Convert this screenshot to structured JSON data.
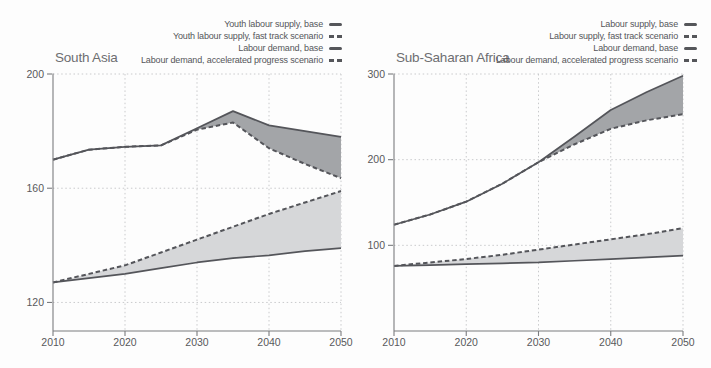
{
  "colors": {
    "line": "#54555a",
    "band_dark": "#a3a5a8",
    "band_light": "#d6d7d9",
    "grid": "#c9cacc",
    "axis": "#7b7c7f",
    "tick_text": "#58595b",
    "title_text": "#6d6e71"
  },
  "chart_data": [
    {
      "type": "line",
      "title": "South Asia",
      "x": [
        2010,
        2015,
        2020,
        2025,
        2030,
        2035,
        2040,
        2045,
        2050
      ],
      "xticks": [
        2010,
        2020,
        2030,
        2040,
        2050
      ],
      "yticks": [
        120,
        160,
        200
      ],
      "ylim": [
        110,
        200
      ],
      "grid": true,
      "legend_position": "top-right",
      "series": [
        {
          "label": "Youth labour supply, base",
          "style": "solid",
          "values": [
            170,
            173.5,
            174.5,
            175,
            181,
            187,
            182,
            180,
            178
          ]
        },
        {
          "label": "Youth labour supply, fast track scenario",
          "style": "dashed",
          "values": [
            170,
            173.5,
            174.5,
            175,
            180.5,
            183,
            174,
            168.5,
            163.5
          ]
        },
        {
          "label": "Labour demand, base",
          "style": "solid",
          "values": [
            127,
            128.5,
            130,
            132,
            134,
            135.5,
            136.5,
            138,
            139
          ]
        },
        {
          "label": "Labour demand, accelerated progress scenario",
          "style": "dashed",
          "values": [
            127,
            130,
            133,
            137.5,
            142,
            146.5,
            151,
            155,
            159
          ]
        }
      ],
      "bands": [
        {
          "upper": 0,
          "lower": 1,
          "tone": "band_dark"
        },
        {
          "upper": 3,
          "lower": 2,
          "tone": "band_light"
        }
      ]
    },
    {
      "type": "line",
      "title": "Sub-Saharan Africa",
      "x": [
        2010,
        2015,
        2020,
        2025,
        2030,
        2035,
        2040,
        2045,
        2050
      ],
      "xticks": [
        2010,
        2020,
        2030,
        2040,
        2050
      ],
      "yticks": [
        100,
        200,
        300
      ],
      "ylim": [
        0,
        300
      ],
      "grid": true,
      "legend_position": "top-right",
      "series": [
        {
          "label": "Labour supply, base",
          "style": "solid",
          "values": [
            124,
            136,
            151,
            172,
            197,
            227,
            258,
            279,
            298
          ]
        },
        {
          "label": "Labour supply, fast track scenario",
          "style": "dashed",
          "values": [
            124,
            136,
            151,
            172,
            197,
            218,
            236,
            246,
            253
          ]
        },
        {
          "label": "Labour demand, base",
          "style": "solid",
          "values": [
            76,
            77,
            78,
            79,
            80,
            82,
            84,
            86,
            88
          ]
        },
        {
          "label": "Labour demand, accelerated progress scenario",
          "style": "dashed",
          "values": [
            76,
            80,
            84,
            89,
            95,
            101,
            107,
            113,
            120
          ]
        }
      ],
      "bands": [
        {
          "upper": 0,
          "lower": 1,
          "tone": "band_dark"
        },
        {
          "upper": 3,
          "lower": 2,
          "tone": "band_light"
        }
      ]
    }
  ]
}
